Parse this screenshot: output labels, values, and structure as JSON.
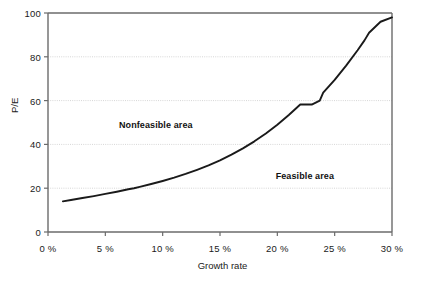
{
  "chart_data": {
    "type": "line",
    "title": "",
    "xlabel": "Growth rate",
    "ylabel": "P/E",
    "xlim": [
      0,
      30
    ],
    "ylim": [
      0,
      100
    ],
    "grid": true,
    "legend": "none",
    "x_tick_labels": [
      "0 %",
      "5 %",
      "10 %",
      "15 %",
      "20 %",
      "25 %",
      "30 %"
    ],
    "x_tick_values": [
      0,
      5,
      10,
      15,
      20,
      25,
      30
    ],
    "y_tick_labels": [
      "0",
      "20",
      "40",
      "60",
      "80",
      "100"
    ],
    "y_tick_values": [
      0,
      20,
      40,
      60,
      80,
      100
    ],
    "series": [
      {
        "name": "P/E vs growth rate",
        "color": "#1a1a1a",
        "x": [
          1.3,
          2,
          3,
          4,
          5,
          6,
          7,
          7.5,
          8,
          9,
          10,
          11,
          12,
          13,
          14,
          15,
          16,
          17,
          18,
          19,
          20,
          21,
          22,
          23,
          23.7,
          24,
          25,
          26,
          27,
          27.6,
          28,
          29,
          30
        ],
        "y": [
          14,
          14.6,
          15.5,
          16.4,
          17.4,
          18.4,
          19.5,
          20,
          20.6,
          21.9,
          23.3,
          24.8,
          26.5,
          28.4,
          30.4,
          32.7,
          35.3,
          38.2,
          41.4,
          45,
          49,
          53.4,
          58.2,
          58.2,
          60,
          63.6,
          69.5,
          76,
          83,
          87.5,
          91,
          96,
          98
        ]
      }
    ],
    "annotations": [
      {
        "text": "Nonfeasible area",
        "x": 9.4,
        "y": 49
      },
      {
        "text": "Feasible area",
        "x": 22.4,
        "y": 25.5
      }
    ]
  },
  "colors": {
    "curve": "#1a1a1a",
    "axis": "#6b6b6b",
    "grid": "#d6d6d6",
    "text": "#1a1a1a",
    "background": "#ffffff"
  }
}
